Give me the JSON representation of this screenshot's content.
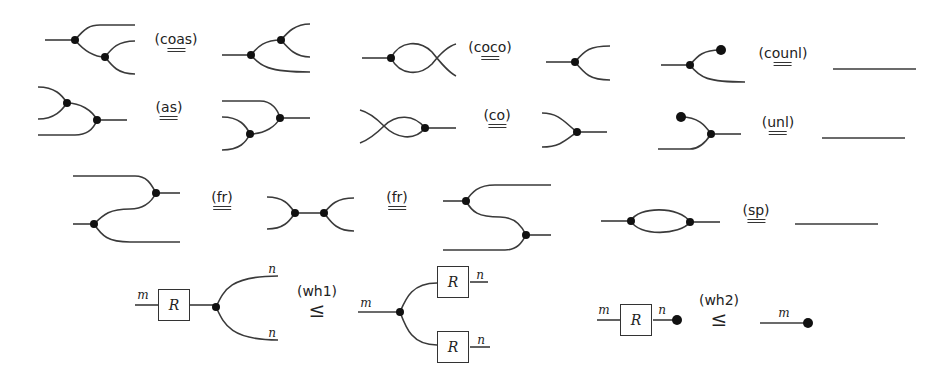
{
  "axioms": [
    {
      "id": "coas",
      "label": "(coas)",
      "relation": "="
    },
    {
      "id": "coco",
      "label": "(coco)",
      "relation": "="
    },
    {
      "id": "counl",
      "label": "(counl)",
      "relation": "="
    },
    {
      "id": "as",
      "label": "(as)",
      "relation": "="
    },
    {
      "id": "co",
      "label": "(co)",
      "relation": "="
    },
    {
      "id": "unl",
      "label": "(unl)",
      "relation": "="
    },
    {
      "id": "fr1",
      "label": "(fr)",
      "relation": "="
    },
    {
      "id": "fr2",
      "label": "(fr)",
      "relation": "="
    },
    {
      "id": "sp",
      "label": "(sp)",
      "relation": "="
    },
    {
      "id": "wh1",
      "label": "(wh1)",
      "relation": "≤"
    },
    {
      "id": "wh2",
      "label": "(wh2)",
      "relation": "≤"
    }
  ],
  "wire_labels": {
    "m": "m",
    "n": "n"
  },
  "box_label": "R",
  "colors": {
    "wire": "#3a3a3a",
    "dot": "#111111",
    "background": "#ffffff"
  }
}
